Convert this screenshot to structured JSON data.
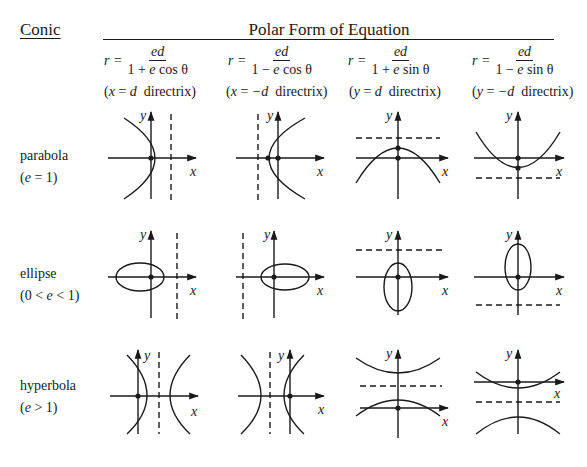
{
  "header": {
    "conic_label": "Conic",
    "polar_label": "Polar Form of Equation"
  },
  "columns": [
    {
      "lhs": "r =",
      "numerator": "ed",
      "denominator_pre": "1 + ",
      "denominator_e": "e",
      "denominator_post": " cos θ",
      "directrix_open": "(",
      "directrix_var": "x",
      "directrix_eq": " = ",
      "directrix_val": "d",
      "directrix_word": "  directrix)"
    },
    {
      "lhs": "r =",
      "numerator": "ed",
      "denominator_pre": "1 − ",
      "denominator_e": "e",
      "denominator_post": " cos θ",
      "directrix_open": "(",
      "directrix_var": "x",
      "directrix_eq": " = ",
      "directrix_val": "−d",
      "directrix_word": "  directrix)"
    },
    {
      "lhs": "r =",
      "numerator": "ed",
      "denominator_pre": "1 + ",
      "denominator_e": "e",
      "denominator_post": " sin θ",
      "directrix_open": "(",
      "directrix_var": "y",
      "directrix_eq": " = ",
      "directrix_val": "d",
      "directrix_word": "  directrix)"
    },
    {
      "lhs": "r =",
      "numerator": "ed",
      "denominator_pre": "1 − ",
      "denominator_e": "e",
      "denominator_post": " sin θ",
      "directrix_open": "(",
      "directrix_var": "y",
      "directrix_eq": " = ",
      "directrix_val": "−d",
      "directrix_word": "  directrix)"
    }
  ],
  "rows": [
    {
      "name": "parabola",
      "cond_open": "(",
      "cond_var": "e",
      "cond_rest": " = 1)"
    },
    {
      "name": "ellipse",
      "cond_open": "(0 < ",
      "cond_var": "e",
      "cond_rest": " < 1)"
    },
    {
      "name": "hyperbola",
      "cond_open": "(",
      "cond_var": "e",
      "cond_rest": " > 1)"
    }
  ],
  "axis_labels": {
    "x": "x",
    "y": "y"
  },
  "colors": {
    "ink": "#1a1a1a",
    "background": "#ffffff"
  }
}
